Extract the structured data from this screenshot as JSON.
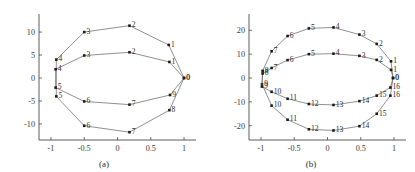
{
  "figure": {
    "title": "",
    "panels": [
      "a",
      "b"
    ]
  },
  "chart_data": [
    {
      "type": "scatter",
      "panel": "a",
      "caption": "(a)",
      "title": "",
      "xlabel": "",
      "ylabel": "",
      "xlim": [
        -1.18,
        1.18
      ],
      "ylim": [
        -13.5,
        13.5
      ],
      "grid": false,
      "legend": "none",
      "xticks": [
        -1,
        -0.5,
        0,
        0.5,
        1
      ],
      "xticklabels": [
        "-1",
        "-0.5",
        "0",
        "0.5",
        "1"
      ],
      "yticks": [
        -10,
        -5,
        0,
        5,
        10
      ],
      "yticklabels": [
        "-10",
        "-5",
        "0",
        "5",
        "10"
      ],
      "series": [
        {
          "name": "outer-curve",
          "closed": true,
          "points": [
            {
              "label": "0",
              "x": 1.0,
              "y": 0.0
            },
            {
              "label": "1",
              "x": 0.77,
              "y": 7.2
            },
            {
              "label": "2",
              "x": 0.18,
              "y": 11.4
            },
            {
              "label": "3",
              "x": -0.5,
              "y": 10.0
            },
            {
              "label": "4",
              "x": -0.92,
              "y": 4.0
            },
            {
              "label": "5",
              "x": -0.92,
              "y": -4.0
            },
            {
              "label": "6",
              "x": -0.5,
              "y": -10.4
            },
            {
              "label": "7",
              "x": 0.18,
              "y": -11.8
            },
            {
              "label": "8",
              "x": 0.78,
              "y": -7.0
            }
          ]
        },
        {
          "name": "inner-curve",
          "closed": true,
          "points": [
            {
              "label": "0",
              "x": 1.0,
              "y": 0.0
            },
            {
              "label": "1",
              "x": 0.78,
              "y": 3.5
            },
            {
              "label": "2",
              "x": 0.18,
              "y": 5.6
            },
            {
              "label": "3",
              "x": -0.5,
              "y": 4.9
            },
            {
              "label": "4",
              "x": -0.93,
              "y": 1.9
            },
            {
              "label": "5",
              "x": -0.93,
              "y": -2.1
            },
            {
              "label": "6",
              "x": -0.5,
              "y": -5.1
            },
            {
              "label": "7",
              "x": 0.18,
              "y": -5.8
            },
            {
              "label": "9",
              "x": 0.79,
              "y": -3.7
            }
          ]
        }
      ]
    },
    {
      "type": "scatter",
      "panel": "b",
      "caption": "(b)",
      "title": "",
      "xlabel": "",
      "ylabel": "",
      "xlim": [
        -1.18,
        1.18
      ],
      "ylim": [
        -26,
        26
      ],
      "grid": false,
      "legend": "none",
      "xticks": [
        -1,
        -0.5,
        0,
        0.5,
        1
      ],
      "xticklabels": [
        "-1",
        "-0.5",
        "0",
        "0.5",
        "1"
      ],
      "yticks": [
        -20,
        -10,
        0,
        10,
        20
      ],
      "yticklabels": [
        "-20",
        "-10",
        "0",
        "10",
        "20"
      ],
      "series": [
        {
          "name": "outer-curve",
          "closed": true,
          "points": [
            {
              "label": "0",
              "x": 0.985,
              "y": 0.0
            },
            {
              "label": "1",
              "x": 0.955,
              "y": 7.0
            },
            {
              "label": "2",
              "x": 0.74,
              "y": 14.3
            },
            {
              "label": "3",
              "x": 0.48,
              "y": 18.2
            },
            {
              "label": "4",
              "x": 0.09,
              "y": 21.2
            },
            {
              "label": "5",
              "x": -0.28,
              "y": 20.8
            },
            {
              "label": "6",
              "x": -0.6,
              "y": 17.6
            },
            {
              "label": "7",
              "x": -0.84,
              "y": 11.2
            },
            {
              "label": "8",
              "x": -0.975,
              "y": 3.0
            },
            {
              "label": "9",
              "x": -0.985,
              "y": -2.6
            },
            {
              "label": "10",
              "x": -0.84,
              "y": -11.6
            },
            {
              "label": "11",
              "x": -0.6,
              "y": -17.5
            },
            {
              "label": "12",
              "x": -0.28,
              "y": -21.5
            },
            {
              "label": "13",
              "x": 0.09,
              "y": -22.0
            },
            {
              "label": "14",
              "x": 0.48,
              "y": -20.2
            },
            {
              "label": "15",
              "x": 0.74,
              "y": -15.0
            },
            {
              "label": "16",
              "x": 0.945,
              "y": -7.4
            }
          ]
        },
        {
          "name": "inner-curve",
          "closed": true,
          "points": [
            {
              "label": "0",
              "x": 0.985,
              "y": 0.0
            },
            {
              "label": "1",
              "x": 0.955,
              "y": 3.4
            },
            {
              "label": "2",
              "x": 0.74,
              "y": 7.6
            },
            {
              "label": "3",
              "x": 0.48,
              "y": 9.3
            },
            {
              "label": "4",
              "x": 0.09,
              "y": 10.2
            },
            {
              "label": "5",
              "x": -0.28,
              "y": 10.0
            },
            {
              "label": "6",
              "x": -0.6,
              "y": 7.5
            },
            {
              "label": "7",
              "x": -0.84,
              "y": 4.2
            },
            {
              "label": "8",
              "x": -0.975,
              "y": 1.9
            },
            {
              "label": "9",
              "x": -0.985,
              "y": -3.6
            },
            {
              "label": "10",
              "x": -0.84,
              "y": -5.8
            },
            {
              "label": "11",
              "x": -0.6,
              "y": -8.7
            },
            {
              "label": "12",
              "x": -0.28,
              "y": -10.9
            },
            {
              "label": "13",
              "x": 0.09,
              "y": -11.3
            },
            {
              "label": "14",
              "x": 0.48,
              "y": -9.7
            },
            {
              "label": "15",
              "x": 0.74,
              "y": -7.4
            },
            {
              "label": "16",
              "x": 0.945,
              "y": -4.0
            }
          ]
        }
      ]
    }
  ]
}
